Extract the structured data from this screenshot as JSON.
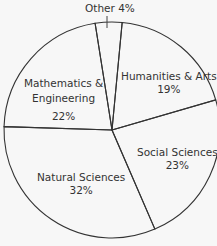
{
  "chart_data": {
    "type": "pie",
    "title": "",
    "categories": [
      "Other",
      "Humanities & Arts",
      "Social Sciences",
      "Natural Sciences",
      "Mathematics & Engineering"
    ],
    "values": [
      4,
      19,
      23,
      32,
      22
    ],
    "unit": "%",
    "legend": "none (direct labels)",
    "colors": {
      "fill": "#ffffff",
      "stroke": "#333333",
      "background": "#f7f7f7"
    }
  },
  "labels": {
    "other": "Other 4%",
    "humanities_name": "Humanities & Arts",
    "humanities_pct": "19%",
    "social_name": "Social Sciences",
    "social_pct": "23%",
    "natural_name": "Natural Sciences",
    "natural_pct": "32%",
    "math_name_1": "Mathematics &",
    "math_name_2": "Engineering",
    "math_pct": "22%"
  }
}
